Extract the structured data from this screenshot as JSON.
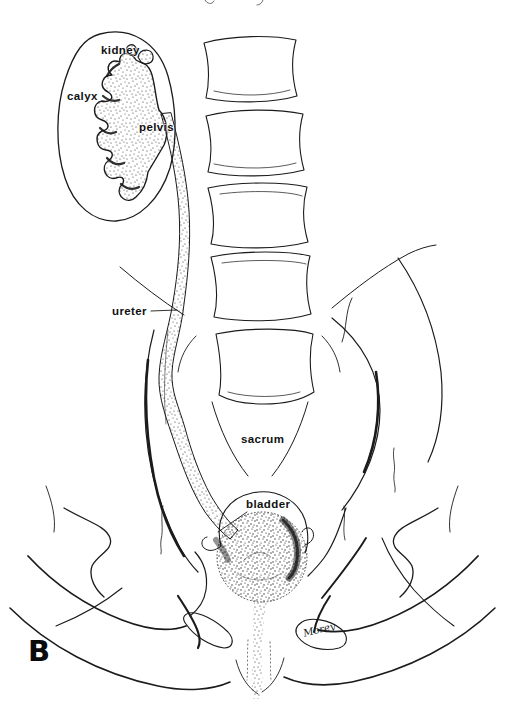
{
  "figure": {
    "type": "anatomical-line-illustration",
    "panel_letter": "B",
    "signature": "Morey",
    "labels": {
      "kidney": "kidney",
      "calyx": "calyx",
      "pelvis": "pelvis",
      "ureter": "ureter",
      "sacrum": "sacrum",
      "bladder": "bladder"
    },
    "colors": {
      "ink": "#1b1b1b",
      "background": "#ffffff"
    }
  }
}
